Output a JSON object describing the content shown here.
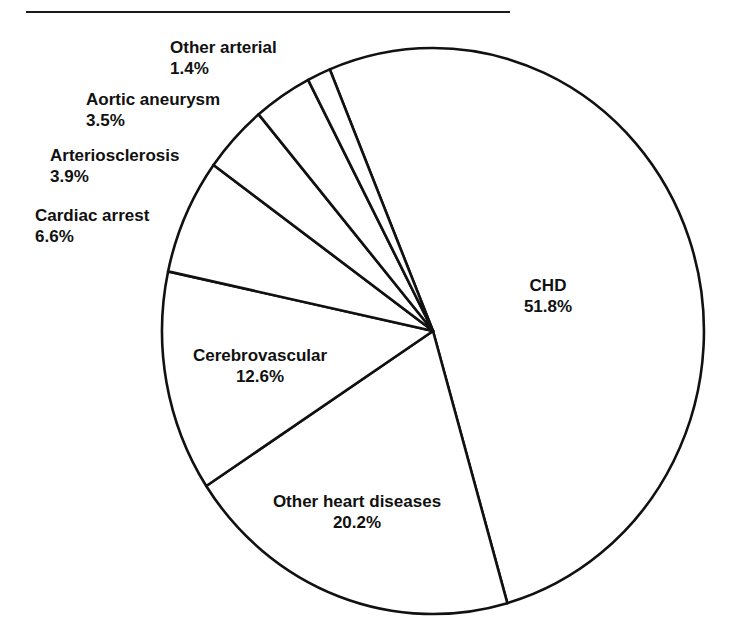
{
  "chart_data": {
    "type": "pie",
    "title": "",
    "start_angle_deg_from_top": -22.4,
    "direction": "clockwise",
    "slices": [
      {
        "label": "CHD",
        "value": 51.8,
        "value_label": "51.8%"
      },
      {
        "label": "Other heart diseases",
        "value": 20.2,
        "value_label": "20.2%"
      },
      {
        "label": "Cerebrovascular",
        "value": 12.6,
        "value_label": "12.6%"
      },
      {
        "label": "Cardiac arrest",
        "value": 6.6,
        "value_label": "6.6%"
      },
      {
        "label": "Arteriosclerosis",
        "value": 3.9,
        "value_label": "3.9%"
      },
      {
        "label": "Aortic aneurysm",
        "value": 3.5,
        "value_label": "3.5%"
      },
      {
        "label": "Other arterial",
        "value": 1.4,
        "value_label": "1.4%"
      }
    ],
    "categories": [
      "CHD",
      "Other heart diseases",
      "Cerebrovascular",
      "Cardiac arrest",
      "Arteriosclerosis",
      "Aortic aneurysm",
      "Other arterial"
    ],
    "values": [
      51.8,
      20.2,
      12.6,
      6.6,
      3.9,
      3.5,
      1.4
    ],
    "fill_color": "#ffffff",
    "stroke_color": "#111111",
    "legend": "none"
  },
  "labels": {
    "chd": {
      "name": "CHD",
      "pct": "51.8%"
    },
    "other_heart": {
      "name": "Other heart diseases",
      "pct": "20.2%"
    },
    "cerebrovascular": {
      "name": "Cerebrovascular",
      "pct": "12.6%"
    },
    "cardiac_arrest": {
      "name": "Cardiac arrest",
      "pct": "6.6%"
    },
    "arteriosclerosis": {
      "name": "Arteriosclerosis",
      "pct": "3.9%"
    },
    "aortic_aneurysm": {
      "name": "Aortic aneurysm",
      "pct": "3.5%"
    },
    "other_arterial": {
      "name": "Other arterial",
      "pct": "1.4%"
    }
  }
}
